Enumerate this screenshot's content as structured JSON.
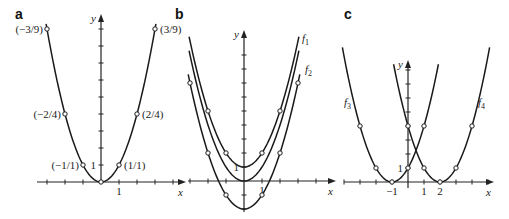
{
  "chart_data": [
    {
      "panel": "a",
      "type": "line",
      "title": "",
      "xlabel": "x",
      "ylabel": "y",
      "origin_px": [
        101,
        182
      ],
      "unit_px": [
        18,
        17
      ],
      "x_axis_px": [
        37,
        180
      ],
      "y_axis_px": [
        184,
        20
      ],
      "x_ticks": [
        -3,
        -2,
        -1,
        1,
        2,
        3,
        4
      ],
      "y_ticks": [
        1,
        2,
        3,
        4,
        5,
        6,
        7,
        8,
        9
      ],
      "tick_labels": [
        {
          "text": "1",
          "axis": "x",
          "value": 1
        },
        {
          "text": "1",
          "axis": "y",
          "value": 1
        }
      ],
      "series": [
        {
          "name": "y = x^2",
          "a": 1,
          "h": 0,
          "k": 0,
          "xrange": [
            -3.05,
            3.05
          ]
        }
      ],
      "points": [
        {
          "x": -3,
          "y": 9,
          "label": "(−3/9)",
          "anchor": "end"
        },
        {
          "x": -2,
          "y": 4,
          "label": "(−2/4)",
          "anchor": "end"
        },
        {
          "x": -1,
          "y": 1,
          "label": "(−1/1)",
          "anchor": "end"
        },
        {
          "x": 0,
          "y": 0,
          "label": "",
          "anchor": "start"
        },
        {
          "x": 1,
          "y": 1,
          "label": "(1/1)",
          "anchor": "start"
        },
        {
          "x": 2,
          "y": 4,
          "label": "(2/4)",
          "anchor": "start"
        },
        {
          "x": 3,
          "y": 9,
          "label": "(3/9)",
          "anchor": "start"
        }
      ]
    },
    {
      "panel": "b",
      "type": "line",
      "title": "",
      "xlabel": "x",
      "ylabel": "y",
      "origin_px": [
        244,
        181
      ],
      "unit_px": [
        18,
        14
      ],
      "x_axis_px": [
        188,
        330
      ],
      "y_axis_px": [
        212,
        36
      ],
      "x_ticks": [
        -3,
        -2,
        -1,
        1,
        2,
        3,
        4
      ],
      "y_ticks": [
        -2,
        -1,
        1,
        2,
        3,
        4,
        5,
        6,
        7,
        8,
        9
      ],
      "tick_labels": [
        {
          "text": "1",
          "axis": "x",
          "value": 1
        },
        {
          "text": "1",
          "axis": "y",
          "value": 1
        }
      ],
      "series": [
        {
          "name": "f1",
          "formula": "y = x^2 + 1",
          "a": 1,
          "h": 0,
          "k": 1,
          "xrange": [
            -3.05,
            3.05
          ],
          "label": "f",
          "sub": "1"
        },
        {
          "name": "f0",
          "formula": "y = x^2",
          "a": 1,
          "h": 0,
          "k": 0,
          "xrange": [
            -3.05,
            3.05
          ],
          "label": "",
          "sub": ""
        },
        {
          "name": "f2",
          "formula": "y = x^2 - 2",
          "a": 1,
          "h": 0,
          "k": -2,
          "xrange": [
            -3.1,
            3.1
          ],
          "label": "f",
          "sub": "2"
        }
      ],
      "points": [
        {
          "x": -2,
          "y": 5
        },
        {
          "x": -1,
          "y": 2
        },
        {
          "x": 1,
          "y": 2
        },
        {
          "x": 2,
          "y": 5
        },
        {
          "x": -3,
          "y": 7
        },
        {
          "x": -2,
          "y": 2
        },
        {
          "x": -1,
          "y": -1
        },
        {
          "x": 1,
          "y": -1
        },
        {
          "x": 2,
          "y": 2
        },
        {
          "x": 3,
          "y": 7
        }
      ],
      "series_labels": [
        {
          "text": "f",
          "sub": "1",
          "px": [
            302,
            42
          ]
        },
        {
          "text": "f",
          "sub": "2",
          "px": [
            305,
            73
          ]
        }
      ]
    },
    {
      "panel": "c",
      "type": "line",
      "title": "",
      "xlabel": "x",
      "ylabel": "y",
      "origin_px": [
        408,
        182
      ],
      "unit_px": [
        16,
        14
      ],
      "x_axis_px": [
        344,
        488
      ],
      "y_axis_px": [
        188,
        66
      ],
      "x_ticks": [
        -4,
        -3,
        -2,
        -1,
        1,
        2,
        3,
        4,
        5
      ],
      "y_ticks": [
        1,
        2,
        3,
        4,
        5,
        6,
        7,
        8
      ],
      "tick_labels": [
        {
          "text": "−1",
          "axis": "x",
          "value": -1
        },
        {
          "text": "1",
          "axis": "x",
          "value": 1
        },
        {
          "text": "2",
          "axis": "x",
          "value": 2
        },
        {
          "text": "1",
          "axis": "y",
          "value": 1
        }
      ],
      "series": [
        {
          "name": "f3",
          "formula": "y = (x + 1)^2",
          "a": 1,
          "h": -1,
          "k": 0,
          "xrange": [
            -4.1,
            1.9
          ],
          "label": "f",
          "sub": "3"
        },
        {
          "name": "f4",
          "formula": "y = (x - 2)^2",
          "a": 1,
          "h": 2,
          "k": 0,
          "xrange": [
            -0.9,
            5.1
          ],
          "label": "f",
          "sub": "4"
        }
      ],
      "points": [
        {
          "x": -3,
          "y": 4
        },
        {
          "x": -2,
          "y": 1
        },
        {
          "x": -1,
          "y": 0
        },
        {
          "x": 0,
          "y": 1
        },
        {
          "x": 1,
          "y": 4
        },
        {
          "x": 0,
          "y": 4
        },
        {
          "x": 1,
          "y": 1
        },
        {
          "x": 2,
          "y": 0
        },
        {
          "x": 3,
          "y": 1
        },
        {
          "x": 4,
          "y": 4
        }
      ],
      "series_labels": [
        {
          "text": "f",
          "sub": "3",
          "px": [
            344,
            106
          ]
        },
        {
          "text": "f",
          "sub": "4",
          "px": [
            478,
            106
          ]
        }
      ]
    }
  ],
  "panels": {
    "a": {
      "label": "a"
    },
    "b": {
      "label": "b"
    },
    "c": {
      "label": "c"
    }
  },
  "axis_labels": {
    "x": "x",
    "y": "y"
  }
}
